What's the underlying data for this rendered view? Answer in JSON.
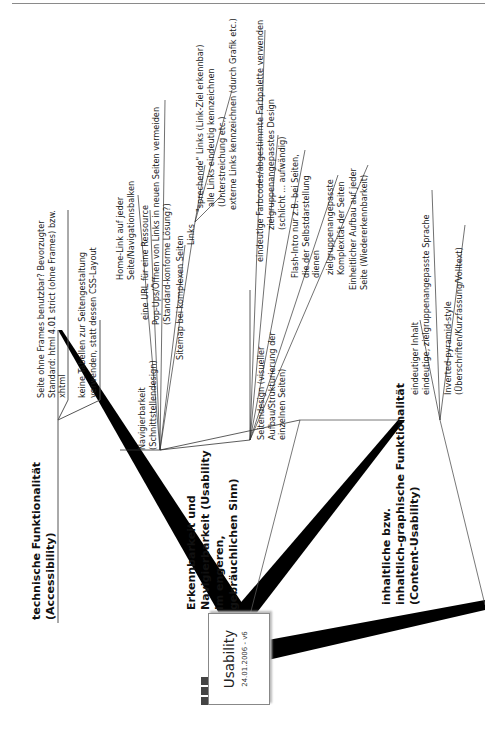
{
  "page_number": "5",
  "root": {
    "title": "Usability",
    "date": "24.01.2006 - v6",
    "icons": [
      "note-icon",
      "note-icon",
      "note-icon"
    ]
  },
  "branches": [
    {
      "title_lines": [
        "technische Funktionalität",
        "(Accessibility)"
      ],
      "children": [
        {
          "lines": [
            "Seite ohne Frames benutzbar? Bevorzugter",
            "Standard: html 4.01 strict (ohne Frames) bzw.",
            "xhtml"
          ]
        },
        {
          "lines": [
            "keine Tabellen zur Seitengestaltung",
            "verwenden, statt dessen CSS-Layout"
          ]
        }
      ]
    },
    {
      "title_lines": [
        "Erkennbarkeit und",
        "Navigierbarkeit (Usability",
        "im engeren,",
        "gebräuchlichen Sinn)"
      ],
      "children": [
        {
          "lines": [
            "Navigierbarkeit",
            "(Schnittstellendesign)"
          ],
          "children": [
            {
              "lines": [
                "Home-Link auf jeder",
                "Seite/Navigationsbalken"
              ]
            },
            {
              "lines": [
                "eine URL für eine Ressource"
              ]
            },
            {
              "lines": [
                "Pop-Ups/Öffnen von Links in neuen Seiten vermeiden",
                "(Standard-konforme Lösung?)"
              ]
            },
            {
              "lines": [
                "Sitemap bei komplexen Seiten"
              ]
            },
            {
              "lines": [
                "Links"
              ],
              "children": [
                {
                  "lines": [
                    "\"sprechende\" Links (Link-Ziel erkennbar)"
                  ]
                },
                {
                  "lines": [
                    "alle Links eindeutig kennzeichnen",
                    "(Unterstreichung etc.)"
                  ]
                },
                {
                  "lines": [
                    "externe Links kennzeichnen (durch Grafik etc.)"
                  ]
                }
              ]
            }
          ]
        },
        {
          "lines": [
            "Seitendesign (visueller",
            "Aufbau/Strukturierung der",
            "einzelnen Seiten)"
          ],
          "children": [
            {
              "lines": [
                "eindeutige Farbcodes/abgestimmte Farbpalette verwenden"
              ]
            },
            {
              "lines": [
                "zielgruppenangepasstes Design",
                "(schlicht ... aufwändig)"
              ]
            },
            {
              "lines": [
                "Flash-Intro nur z.B. bei Seiten,",
                "die der Selbstdarstellung",
                "dienen"
              ]
            },
            {
              "lines": [
                "zielgruppenangepasste",
                "Komplexität der Seiten"
              ]
            },
            {
              "lines": [
                "Einheitlicher Aufbau auf jeder",
                "Seite (Wiedererkennbarkeit)"
              ]
            }
          ]
        }
      ]
    },
    {
      "title_lines": [
        "inhaltliche bzw.",
        "inhaltlich-graphische Funktionalität",
        "(Content-Usability)"
      ],
      "children": [
        {
          "lines": [
            "eindeutiger Inhalt"
          ]
        },
        {
          "lines": [
            "eindeutige, zielgruppenangepasste Sprache"
          ]
        },
        {
          "lines": [
            "Inverted-pyramid-style",
            "(Überschriften/Kurzfassung/Volltext)"
          ]
        }
      ]
    }
  ]
}
